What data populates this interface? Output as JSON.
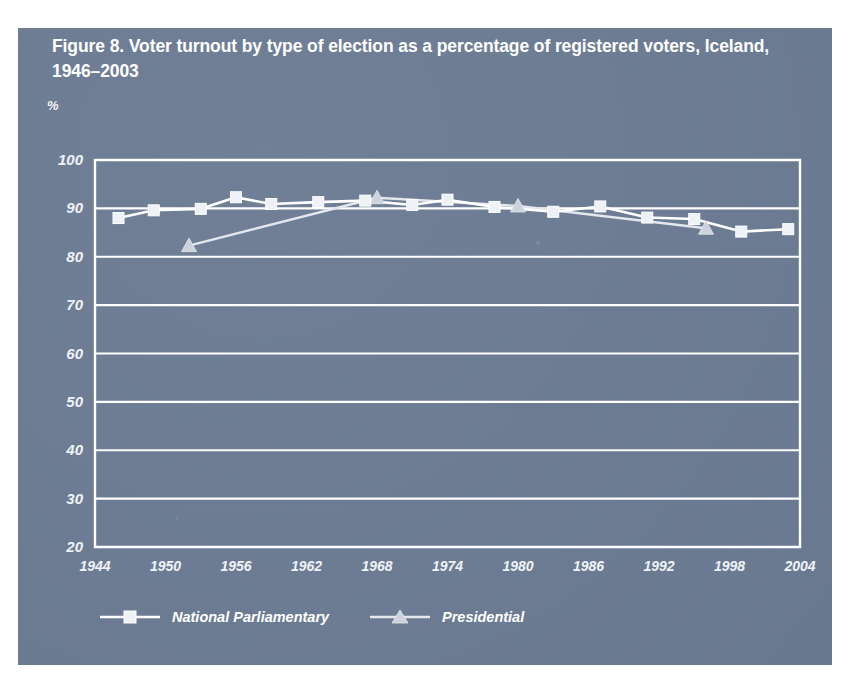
{
  "figure": {
    "title": "Figure 8. Voter turnout by type of election as a percentage of registered voters, Iceland, 1946–2003",
    "unit_label": "%"
  },
  "chart_data": {
    "type": "line",
    "title": "Figure 8. Voter turnout by type of election as a percentage of registered voters, Iceland, 1946–2003",
    "xlabel": "",
    "ylabel": "%",
    "xlim": [
      1944,
      2004
    ],
    "ylim": [
      20,
      100
    ],
    "xticks": [
      1944,
      1950,
      1956,
      1962,
      1968,
      1974,
      1980,
      1986,
      1992,
      1998,
      2004
    ],
    "yticks": [
      20,
      30,
      40,
      50,
      60,
      70,
      80,
      90,
      100
    ],
    "grid": "horizontal",
    "legend_position": "bottom",
    "series": [
      {
        "name": "National Parliamentary",
        "marker": "square",
        "points": [
          {
            "x": 1946,
            "y": 88.0
          },
          {
            "x": 1949,
            "y": 89.6
          },
          {
            "x": 1953,
            "y": 89.9
          },
          {
            "x": 1956,
            "y": 92.3
          },
          {
            "x": 1959,
            "y": 90.9
          },
          {
            "x": 1963,
            "y": 91.3
          },
          {
            "x": 1967,
            "y": 91.6
          },
          {
            "x": 1971,
            "y": 90.7
          },
          {
            "x": 1974,
            "y": 91.8
          },
          {
            "x": 1978,
            "y": 90.3
          },
          {
            "x": 1983,
            "y": 89.3
          },
          {
            "x": 1987,
            "y": 90.4
          },
          {
            "x": 1991,
            "y": 88.1
          },
          {
            "x": 1995,
            "y": 87.8
          },
          {
            "x": 1999,
            "y": 85.2
          },
          {
            "x": 2003,
            "y": 85.7
          }
        ]
      },
      {
        "name": "Presidential",
        "marker": "triangle",
        "points": [
          {
            "x": 1952,
            "y": 82.3
          },
          {
            "x": 1968,
            "y": 92.2
          },
          {
            "x": 1980,
            "y": 90.5
          },
          {
            "x": 1996,
            "y": 85.9
          }
        ]
      }
    ]
  },
  "legend": {
    "items": [
      {
        "label": "National Parliamentary",
        "marker": "square"
      },
      {
        "label": "Presidential",
        "marker": "triangle"
      }
    ]
  }
}
